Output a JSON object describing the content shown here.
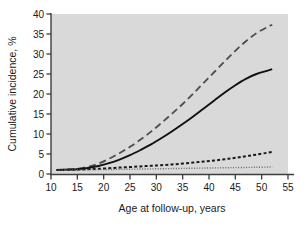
{
  "chart_data": {
    "type": "line",
    "title": "",
    "subtitle": "",
    "xlabel": "Age at follow-up, years",
    "ylabel": "Cumulative incidence, %",
    "xlim": [
      10,
      55
    ],
    "ylim": [
      0,
      40
    ],
    "xticks": [
      10,
      15,
      20,
      25,
      30,
      35,
      40,
      45,
      50,
      55
    ],
    "yticks": [
      0,
      5,
      10,
      15,
      20,
      25,
      30,
      35,
      40
    ],
    "grid": false,
    "legend": "none",
    "plot_background": "#d9d9d9",
    "page_background": "#ffffff",
    "axis_color": "#3d3d3d",
    "x": [
      11,
      13,
      15,
      17,
      19,
      21,
      23,
      25,
      27,
      29,
      31,
      33,
      35,
      37,
      39,
      41,
      43,
      45,
      47,
      49,
      51,
      52
    ],
    "series": [
      {
        "name": "long-dashed-curve",
        "style": "long-dashed",
        "color": "#4d4d4d",
        "width": 1.8,
        "dasharray": "7,4",
        "values": [
          1.0,
          1.1,
          1.3,
          1.8,
          2.6,
          3.8,
          5.2,
          6.8,
          8.6,
          10.6,
          12.8,
          15.1,
          17.5,
          20.1,
          22.8,
          25.5,
          28.2,
          30.8,
          33.2,
          35.2,
          36.7,
          37.3
        ]
      },
      {
        "name": "solid-curve",
        "style": "solid",
        "color": "#111111",
        "width": 1.9,
        "dasharray": "",
        "values": [
          1.0,
          1.1,
          1.2,
          1.5,
          2.0,
          2.7,
          3.6,
          4.7,
          6.0,
          7.4,
          9.0,
          10.7,
          12.5,
          14.4,
          16.4,
          18.4,
          20.4,
          22.2,
          23.8,
          25.0,
          25.8,
          26.2
        ]
      },
      {
        "name": "short-dashed-curve",
        "style": "short-dashed",
        "color": "#1a1a1a",
        "width": 2.0,
        "dasharray": "3,2.2",
        "values": [
          1.0,
          1.05,
          1.1,
          1.2,
          1.3,
          1.45,
          1.6,
          1.75,
          1.9,
          2.05,
          2.2,
          2.4,
          2.6,
          2.85,
          3.1,
          3.35,
          3.7,
          4.05,
          4.45,
          4.85,
          5.3,
          5.5
        ]
      },
      {
        "name": "fine-dotted-curve",
        "style": "dotted",
        "color": "#666666",
        "width": 1.4,
        "dasharray": "1,1.6",
        "values": [
          1.0,
          1.0,
          1.02,
          1.05,
          1.08,
          1.12,
          1.16,
          1.2,
          1.24,
          1.28,
          1.32,
          1.36,
          1.4,
          1.44,
          1.48,
          1.52,
          1.56,
          1.6,
          1.64,
          1.68,
          1.72,
          1.75
        ]
      }
    ]
  }
}
